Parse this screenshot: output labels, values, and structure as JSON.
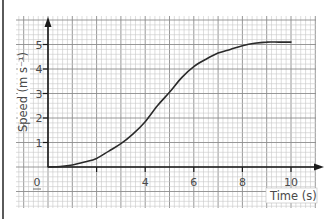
{
  "chart_data": {
    "type": "line",
    "title": "",
    "xlabel": "Time (s)",
    "ylabel": "Speed (m s⁻¹)",
    "xlim": [
      0,
      10
    ],
    "ylim": [
      0,
      5
    ],
    "x_ticks": [
      0,
      2,
      4,
      6,
      8,
      10
    ],
    "x_tick_labels": [
      "0",
      "",
      "4",
      "6",
      "8",
      "10"
    ],
    "y_ticks": [
      1,
      2,
      3,
      4,
      5
    ],
    "y_tick_labels": [
      "1",
      "2",
      "3",
      "4",
      "5"
    ],
    "grid": true,
    "grid_minor_step": 0.2,
    "legend": null,
    "series": [
      {
        "name": "speed",
        "x": [
          0,
          0.5,
          1,
          1.5,
          2,
          2.5,
          3,
          3.5,
          4,
          4.5,
          5,
          5.5,
          6,
          6.5,
          7,
          7.5,
          8,
          8.5,
          9,
          9.5,
          10
        ],
        "values": [
          0,
          0.02,
          0.08,
          0.2,
          0.35,
          0.65,
          0.95,
          1.35,
          1.85,
          2.5,
          3.05,
          3.65,
          4.1,
          4.4,
          4.65,
          4.8,
          4.95,
          5.05,
          5.1,
          5.1,
          5.1
        ]
      }
    ]
  },
  "axes": {
    "x_title": "Time (s)",
    "y_title": "Speed (m s⁻¹)",
    "origin_label": "0"
  },
  "colors": {
    "grid_minor": "#c8c8c8",
    "grid_major": "#8c8c8c",
    "axis": "#1a1a1a",
    "curve": "#2a2a2a",
    "text": "#4a4a4a"
  }
}
